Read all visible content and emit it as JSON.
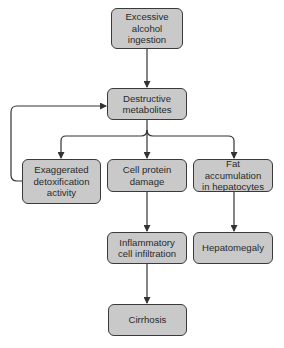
{
  "diagram": {
    "type": "flowchart",
    "colors": {
      "node_fill": "#c9c9c9",
      "node_border": "#3a3a3a",
      "edge": "#333333",
      "background": "#ffffff"
    },
    "nodes": [
      {
        "id": "alcohol",
        "label": "Excessive\nalcohol\ningestion"
      },
      {
        "id": "metabolites",
        "label": "Destructive\nmetabolites"
      },
      {
        "id": "detox",
        "label": "Exaggerated\ndetoxification\nactivity"
      },
      {
        "id": "protein",
        "label": "Cell protein\ndamage"
      },
      {
        "id": "fat",
        "label": "Fat accumulation\nin hepatocytes"
      },
      {
        "id": "inflammatory",
        "label": "Inflammatory\ncell infiltration"
      },
      {
        "id": "hepatomegaly",
        "label": "Hepatomegaly"
      },
      {
        "id": "cirrhosis",
        "label": "Cirrhosis"
      }
    ],
    "edges": [
      {
        "from": "alcohol",
        "to": "metabolites"
      },
      {
        "from": "metabolites",
        "to": "detox"
      },
      {
        "from": "metabolites",
        "to": "protein"
      },
      {
        "from": "metabolites",
        "to": "fat"
      },
      {
        "from": "detox",
        "to": "metabolites",
        "kind": "feedback"
      },
      {
        "from": "protein",
        "to": "inflammatory"
      },
      {
        "from": "fat",
        "to": "hepatomegaly"
      },
      {
        "from": "inflammatory",
        "to": "cirrhosis"
      }
    ]
  }
}
